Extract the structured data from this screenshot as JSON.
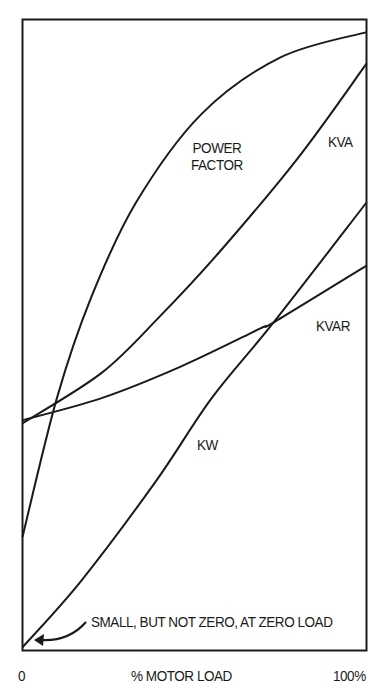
{
  "chart_data": {
    "type": "line",
    "title": "",
    "xlabel": "% MOTOR  LOAD",
    "ylabel": "",
    "x_tick_labels": [
      "0",
      "100%"
    ],
    "xlim": [
      0,
      100
    ],
    "ylim": [
      0,
      100
    ],
    "grid": false,
    "legend": "none (inline curve labels)",
    "series": [
      {
        "name": "KW",
        "label": "KW",
        "x": [
          0,
          17,
          39,
          55,
          73,
          100
        ],
        "values": [
          0.5,
          11,
          27,
          40,
          52,
          71
        ]
      },
      {
        "name": "KVAR",
        "label": "KVAR",
        "x": [
          0,
          23,
          46,
          69,
          73,
          100
        ],
        "values": [
          36.5,
          40,
          45,
          51,
          52,
          61
        ]
      },
      {
        "name": "KVA",
        "label": "KVA",
        "x": [
          0,
          23,
          40,
          57,
          80,
          100
        ],
        "values": [
          36,
          44,
          53,
          63,
          78,
          93
        ]
      },
      {
        "name": "POWER FACTOR",
        "label": "POWER FACTOR",
        "x": [
          0,
          10,
          20,
          33,
          52,
          75,
          100
        ],
        "values": [
          18,
          40,
          56,
          71,
          85,
          94,
          98
        ]
      }
    ],
    "annotations": [
      {
        "text": "SMALL, BUT NOT ZERO, AT ZERO LOAD",
        "points_to": "KW at 0% load",
        "arrow": true
      }
    ]
  },
  "labels": {
    "power": "POWER",
    "factor": "FACTOR",
    "kva": "KVA",
    "kvar": "KVAR",
    "kw": "KW",
    "annotation": "SMALL, BUT NOT ZERO, AT ZERO LOAD",
    "x_start": "0",
    "x_title": "% MOTOR  LOAD",
    "x_end": "100%"
  },
  "colors": {
    "line": "#1a1a1a",
    "background": "#ffffff"
  }
}
